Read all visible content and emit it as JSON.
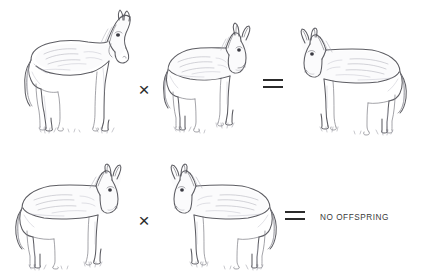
{
  "diagram": {
    "background_color": "#ffffff",
    "ink_color": "#5d5d63",
    "text_color": "#3a3a3a"
  },
  "rows": [
    {
      "id": "cross-1",
      "terms": [
        {
          "role": "parent-1",
          "animal": "horse",
          "facing": "right",
          "icon": "horse-illustration"
        },
        {
          "role": "operator",
          "symbol": "×",
          "name": "multiplication-sign"
        },
        {
          "role": "parent-2",
          "animal": "donkey",
          "facing": "right",
          "icon": "donkey-illustration"
        },
        {
          "role": "operator",
          "symbol": "=",
          "name": "equals-sign"
        },
        {
          "role": "offspring",
          "animal": "mule",
          "facing": "left",
          "icon": "mule-illustration"
        }
      ]
    },
    {
      "id": "cross-2",
      "terms": [
        {
          "role": "parent-1",
          "animal": "mule",
          "facing": "right",
          "icon": "mule-illustration"
        },
        {
          "role": "operator",
          "symbol": "×",
          "name": "multiplication-sign"
        },
        {
          "role": "parent-2",
          "animal": "mule",
          "facing": "left",
          "icon": "mule-illustration"
        },
        {
          "role": "operator",
          "symbol": "=",
          "name": "equals-sign"
        },
        {
          "role": "result-label",
          "text": "NO OFFSPRING"
        }
      ]
    },
    {
      "id": "unused"
    }
  ],
  "labels": {
    "no_offspring": "NO OFFSPRING",
    "times_symbol": "×",
    "equals_symbol": "="
  }
}
